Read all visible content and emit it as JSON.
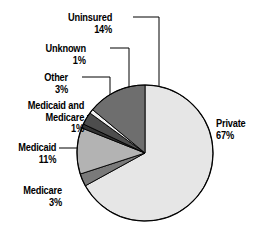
{
  "chart_data": {
    "type": "pie",
    "title": "",
    "subtitle": "",
    "xlabel": "",
    "ylabel": "",
    "legend_position": "none",
    "grid": false,
    "units": "percent",
    "start_angle_deg": 0,
    "direction": "clockwise",
    "categories": [
      "Private",
      "Medicare",
      "Medicaid",
      "Medicaid and Medicare",
      "Other",
      "Unknown",
      "Uninsured"
    ],
    "values": [
      67,
      3,
      11,
      1,
      3,
      1,
      14
    ],
    "slices": [
      {
        "name": "Private",
        "label_line1": "Private",
        "label_line2": "67%",
        "value": 67,
        "percent_text": "67%",
        "color": "#e6e6e6",
        "start_deg": 0.0,
        "sweep_deg": 241.2,
        "label_x": 216,
        "label_y": 118,
        "label_align": "left",
        "leader": false
      },
      {
        "name": "Medicare",
        "label_line1": "Medicare",
        "label_line2": "3%",
        "value": 3,
        "percent_text": "3%",
        "color": "#7a7a7a",
        "start_deg": 241.2,
        "sweep_deg": 10.8,
        "label_x": 62,
        "label_y": 185,
        "label_align": "right",
        "leader": false
      },
      {
        "name": "Medicaid",
        "label_line1": "Medicaid",
        "label_line2": "11%",
        "value": 11,
        "percent_text": "11%",
        "color": "#b3b3b3",
        "start_deg": 252.0,
        "sweep_deg": 39.6,
        "label_x": 56,
        "label_y": 142,
        "label_align": "right",
        "leader": true
      },
      {
        "name": "Medicaid and Medicare",
        "label_line1": "Medicaid and",
        "label_line2": "Medicare",
        "label_line3": "1%",
        "value": 1,
        "percent_text": "1%",
        "color": "#333333",
        "start_deg": 291.6,
        "sweep_deg": 3.6,
        "label_x": 84,
        "label_y": 100,
        "label_align": "right",
        "leader": true
      },
      {
        "name": "Other",
        "label_line1": "Other",
        "label_line2": "3%",
        "value": 3,
        "percent_text": "3%",
        "color": "#4d4d4d",
        "start_deg": 295.2,
        "sweep_deg": 10.8,
        "label_x": 68,
        "label_y": 72,
        "label_align": "right",
        "leader": true
      },
      {
        "name": "Unknown",
        "label_line1": "Unknown",
        "label_line2": "1%",
        "value": 1,
        "percent_text": "1%",
        "color": "#f2f2f2",
        "start_deg": 306.0,
        "sweep_deg": 3.6,
        "label_x": 86,
        "label_y": 43,
        "label_align": "right",
        "leader": true
      },
      {
        "name": "Uninsured",
        "label_line1": "Uninsured",
        "label_line2": "14%",
        "value": 14,
        "percent_text": "14%",
        "color": "#6e6e6e",
        "start_deg": 309.6,
        "sweep_deg": 50.4,
        "label_x": 112,
        "label_y": 12,
        "label_align": "right",
        "leader": true
      }
    ],
    "geometry": {
      "center_x": 145,
      "center_y": 153,
      "radius": 68
    },
    "colors": {
      "background": "#ffffff",
      "outline": "#000000",
      "text": "#000000"
    }
  }
}
